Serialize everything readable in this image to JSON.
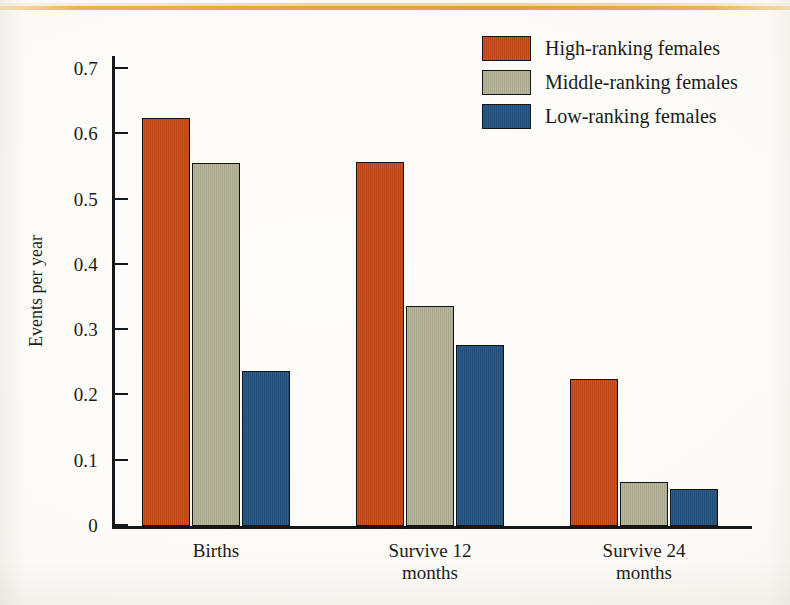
{
  "figure": {
    "background_color": "#fdfcf9",
    "top_rule_color": "#dfa033"
  },
  "chart_data": {
    "type": "bar",
    "title": "",
    "xlabel": "",
    "ylabel": "Events per year",
    "categories": [
      "Births",
      "Survive 12\nmonths",
      "Survive 24\nmonths"
    ],
    "category_labels_flat": [
      "Births",
      "Survive 12 months",
      "Survive 24 months"
    ],
    "series": [
      {
        "name": "High-ranking females",
        "color": "#c6481a",
        "values": [
          0.625,
          0.558,
          0.225
        ]
      },
      {
        "name": "Middle-ranking females",
        "color": "#b1af92",
        "values": [
          0.556,
          0.337,
          0.067
        ]
      },
      {
        "name": "Low-ranking females",
        "color": "#22517f",
        "values": [
          0.238,
          0.277,
          0.056
        ]
      }
    ],
    "ylim": [
      0,
      0.72
    ],
    "yticks": [
      0,
      0.1,
      0.2,
      0.3,
      0.4,
      0.5,
      0.6,
      0.7
    ],
    "ytick_labels": [
      "0",
      "0.1",
      "0.2",
      "0.3",
      "0.4",
      "0.5",
      "0.6",
      "0.7"
    ],
    "grid": false,
    "legend_position": "top-right"
  },
  "legend": {
    "entries": [
      {
        "label": "High-ranking females",
        "color": "#c6481a"
      },
      {
        "label": "Middle-ranking females",
        "color": "#b1af92"
      },
      {
        "label": "Low-ranking females",
        "color": "#22517f"
      }
    ]
  }
}
